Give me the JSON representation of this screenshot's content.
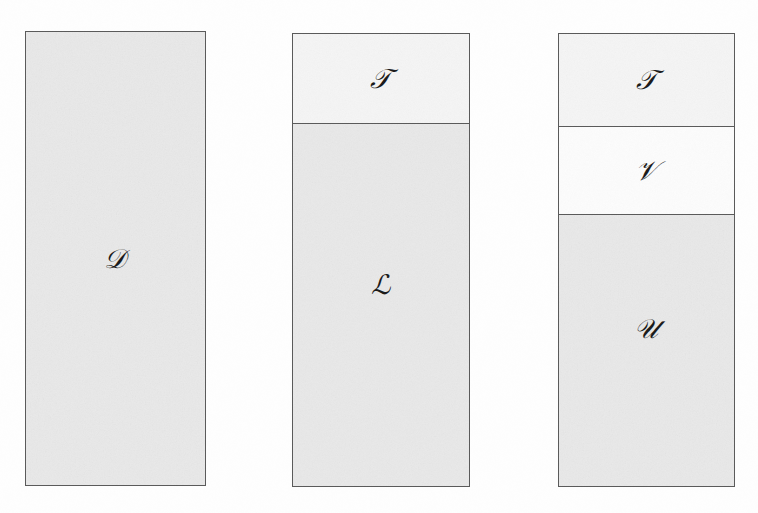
{
  "figure": {
    "background_color": "#fefefe",
    "border_color": "#5a5a5a",
    "symbol_color": "#1a1a1a",
    "blocks": [
      {
        "id": "block-d",
        "name": "dataset-block",
        "segments": [
          {
            "symbol": "𝒟",
            "symbol_name": "script-capital-D",
            "fill": "#e9e9e9",
            "fill_label": "shaded",
            "height_fraction": 1.0
          }
        ]
      },
      {
        "id": "block-tl",
        "name": "train-learn-block",
        "segments": [
          {
            "symbol": "𝒯",
            "symbol_name": "script-capital-T",
            "fill": "#f5f5f5",
            "fill_label": "light",
            "height_fraction": 0.196
          },
          {
            "symbol": "ℒ",
            "symbol_name": "script-capital-L",
            "fill": "#e9e9e9",
            "fill_label": "shaded",
            "height_fraction": 0.804
          }
        ]
      },
      {
        "id": "block-tvu",
        "name": "train-validate-use-block",
        "segments": [
          {
            "symbol": "𝒯",
            "symbol_name": "script-capital-T",
            "fill": "#f5f5f5",
            "fill_label": "light",
            "height_fraction": 0.203
          },
          {
            "symbol": "𝒱",
            "symbol_name": "script-capital-V",
            "fill": "#fcfcfc",
            "fill_label": "white",
            "height_fraction": 0.196
          },
          {
            "symbol": "𝒰",
            "symbol_name": "script-capital-U",
            "fill": "#e9e9e9",
            "fill_label": "shaded",
            "height_fraction": 0.601
          }
        ]
      }
    ]
  }
}
